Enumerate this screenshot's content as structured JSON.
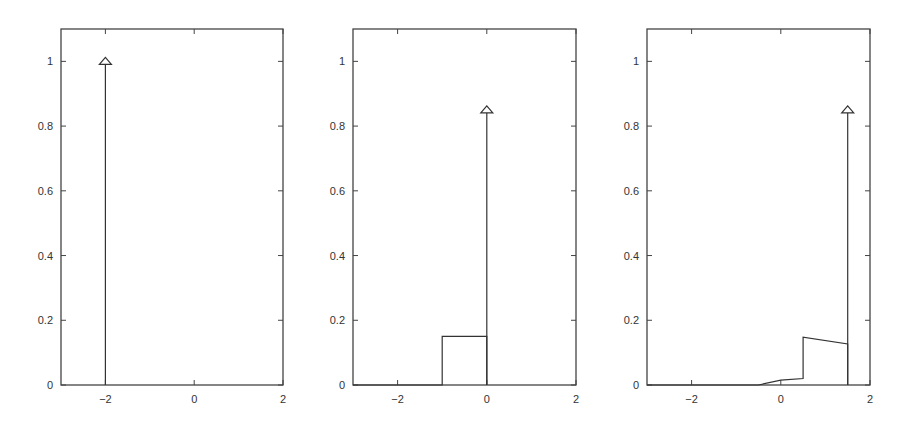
{
  "chart_data": [
    {
      "type": "line",
      "title": "",
      "xlabel": "",
      "ylabel": "",
      "xlim": [
        -3,
        2
      ],
      "ylim": [
        0,
        1.1
      ],
      "xticks": [
        -2,
        0,
        2
      ],
      "xtick_labels": [
        "−2",
        "0",
        "2"
      ],
      "yticks": [
        0,
        0.2,
        0.4,
        0.6,
        0.8,
        1
      ],
      "ytick_labels": [
        "0",
        "0.2",
        "0.4",
        "0.6",
        "0.8",
        "1"
      ],
      "grid": false,
      "series": [
        {
          "name": "continuous part",
          "x": [],
          "y": []
        },
        {
          "name": "point mass (arrow)",
          "x": [
            -2
          ],
          "y": [
            1.0
          ]
        }
      ]
    },
    {
      "type": "line",
      "title": "",
      "xlabel": "",
      "ylabel": "",
      "xlim": [
        -3,
        2
      ],
      "ylim": [
        0,
        1.1
      ],
      "xticks": [
        -2,
        0,
        2
      ],
      "xtick_labels": [
        "−2",
        "0",
        "2"
      ],
      "yticks": [
        0,
        0.2,
        0.4,
        0.6,
        0.8,
        1
      ],
      "ytick_labels": [
        "0",
        "0.2",
        "0.4",
        "0.6",
        "0.8",
        "1"
      ],
      "grid": false,
      "series": [
        {
          "name": "continuous part",
          "x": [
            -3,
            -1,
            -1,
            0,
            0
          ],
          "y": [
            0,
            0,
            0.15,
            0.15,
            0
          ]
        },
        {
          "name": "point mass (arrow)",
          "x": [
            0
          ],
          "y": [
            0.85
          ]
        }
      ]
    },
    {
      "type": "line",
      "title": "",
      "xlabel": "",
      "ylabel": "",
      "xlim": [
        -3,
        2
      ],
      "ylim": [
        0,
        1.1
      ],
      "xticks": [
        -2,
        0,
        2
      ],
      "xtick_labels": [
        "−2",
        "0",
        "2"
      ],
      "yticks": [
        0,
        0.2,
        0.4,
        0.6,
        0.8,
        1
      ],
      "ytick_labels": [
        "0",
        "0.2",
        "0.4",
        "0.6",
        "0.8",
        "1"
      ],
      "grid": false,
      "series": [
        {
          "name": "continuous part",
          "x": [
            -3,
            -0.5,
            0,
            0.5,
            0.5,
            1.5,
            1.5
          ],
          "y": [
            0,
            0,
            0.015,
            0.02,
            0.148,
            0.127,
            0
          ]
        },
        {
          "name": "point mass (arrow)",
          "x": [
            1.5
          ],
          "y": [
            0.85
          ]
        }
      ]
    }
  ],
  "layout": {
    "panels": [
      {
        "left": 61,
        "right": 283,
        "top": 29,
        "bottom": 385
      },
      {
        "left": 353,
        "right": 576,
        "top": 29,
        "bottom": 385
      },
      {
        "left": 647,
        "right": 870,
        "top": 29,
        "bottom": 385
      }
    ]
  }
}
